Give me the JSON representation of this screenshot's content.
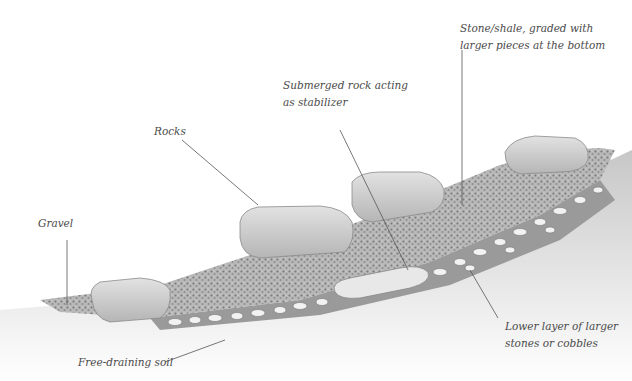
{
  "diagram": {
    "type": "cross-section illustration",
    "labels": {
      "stone_shale": [
        "Stone/shale, graded with",
        "larger pieces at the bottom"
      ],
      "submerged_rock": [
        "Submerged rock acting",
        "as stabilizer"
      ],
      "rocks": [
        "Rocks"
      ],
      "gravel": [
        "Gravel"
      ],
      "lower_layer": [
        "Lower layer of larger",
        "stones or cobbles"
      ],
      "free_draining_soil": [
        "Free-draining soil"
      ]
    },
    "colors": {
      "label_text": "#4a4a4a",
      "leader_line": "#555555",
      "rock_fill": "#d6d6d6",
      "gravel_fill": "#a9a9a9",
      "soil_fill": "#cfcfcf",
      "cobble_fill": "#f2f2f2"
    }
  }
}
